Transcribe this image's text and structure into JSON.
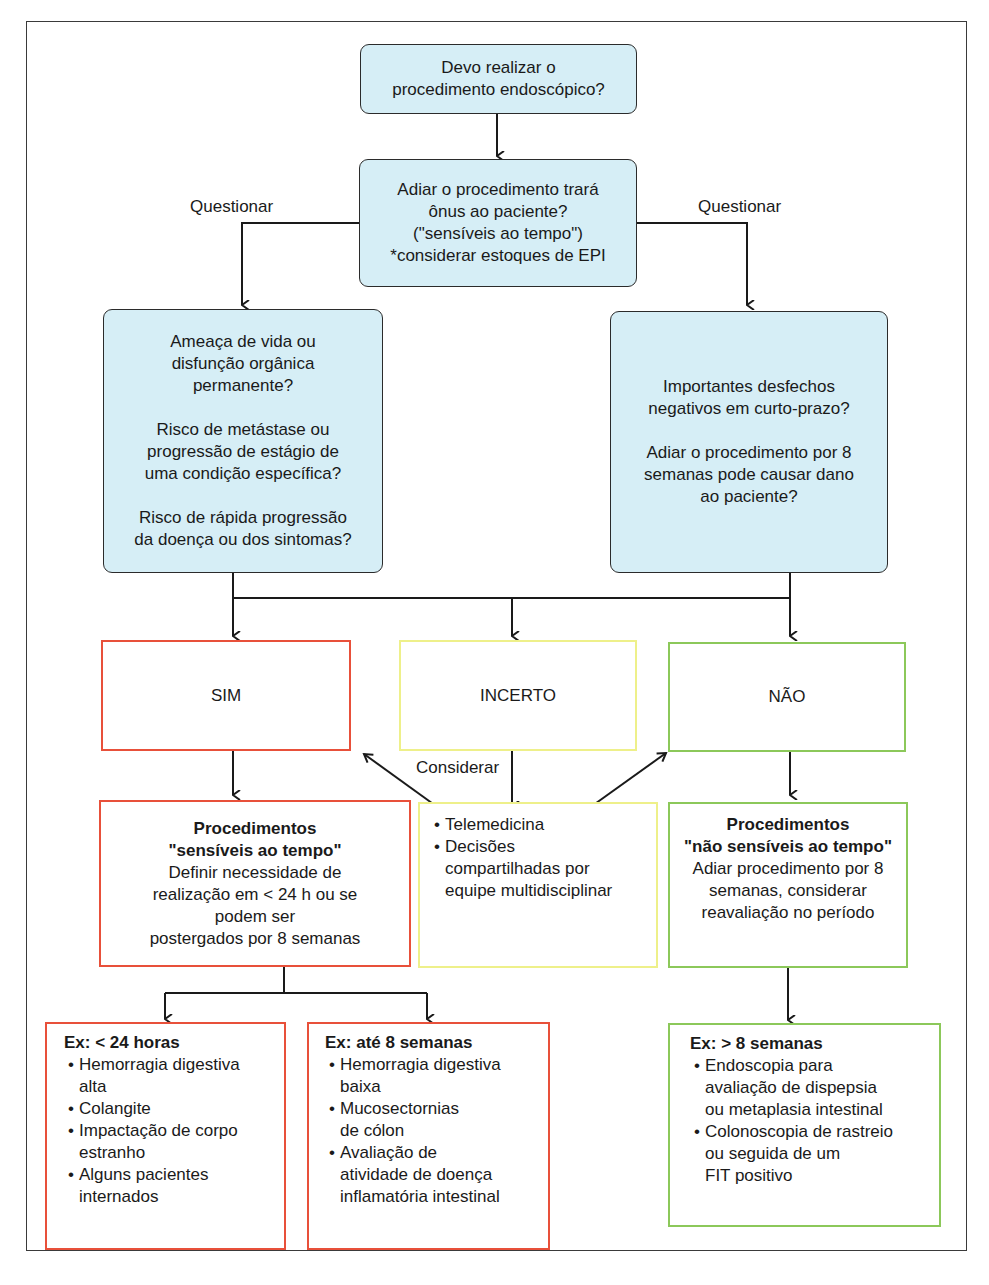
{
  "colors": {
    "question_fill": "#d6eef6",
    "yes": "#e8503a",
    "uncertain": "#eef08a",
    "no": "#8cc85a",
    "lines": "#1a1a1a"
  },
  "start": {
    "lines": [
      "Devo realizar o",
      "procedimento endoscópico?"
    ]
  },
  "burden_question": {
    "lines": [
      "Adiar o procedimento trará",
      "ônus ao paciente?",
      "(\"sensíveis ao tempo\")",
      "*considerar estoques de EPI"
    ]
  },
  "edge_labels": {
    "left": "Questionar",
    "right": "Questionar",
    "consider": "Considerar"
  },
  "left_questions": {
    "groups": [
      [
        "Ameaça de vida ou",
        "disfunção orgânica",
        "permanente?"
      ],
      [
        "Risco de metástase ou",
        "progressão de estágio de",
        "uma condição específica?"
      ],
      [
        "Risco de rápida progressão",
        "da doença ou dos sintomas?"
      ]
    ]
  },
  "right_questions": {
    "groups": [
      [
        "Importantes desfechos",
        "negativos em curto-prazo?"
      ],
      [
        "Adiar o procedimento por 8",
        "semanas pode causar dano",
        "ao paciente?"
      ]
    ]
  },
  "answers": {
    "yes": "SIM",
    "uncertain": "INCERTO",
    "no": "NÃO"
  },
  "yes_outcome": {
    "title_lines": [
      "Procedimentos",
      "\"sensíveis ao tempo\""
    ],
    "body_lines": [
      "Definir necessidade de",
      "realização em < 24 h ou se",
      "podem ser",
      "postergados por 8 semanas"
    ]
  },
  "uncertain_outcome": {
    "bullets": [
      [
        "Telemedicina"
      ],
      [
        "Decisões",
        "compartilhadas por",
        "equipe multidisciplinar"
      ]
    ]
  },
  "no_outcome": {
    "title_lines": [
      "Procedimentos",
      "\"não sensíveis ao tempo\""
    ],
    "body_lines": [
      "Adiar procedimento por 8",
      "semanas, considerar",
      "reavaliação no período"
    ]
  },
  "examples": {
    "under_24h": {
      "title": "Ex: < 24 horas",
      "bullets": [
        [
          "Hemorragia digestiva",
          "alta"
        ],
        [
          "Colangite"
        ],
        [
          "Impactação de corpo",
          "estranho"
        ],
        [
          "Alguns pacientes",
          "internados"
        ]
      ]
    },
    "up_to_8w": {
      "title": "Ex: até 8 semanas",
      "bullets": [
        [
          "Hemorragia digestiva",
          "baixa"
        ],
        [
          "Mucosectornias",
          "de cólon"
        ],
        [
          "Avaliação de",
          "atividade de doença",
          "inflamatória intestinal"
        ]
      ]
    },
    "over_8w": {
      "title": "Ex: > 8 semanas",
      "bullets": [
        [
          "Endoscopia para",
          "avaliação de dispepsia",
          "ou metaplasia intestinal"
        ],
        [
          "Colonoscopia de rastreio",
          "ou seguida de um",
          "FIT positivo"
        ]
      ]
    }
  }
}
